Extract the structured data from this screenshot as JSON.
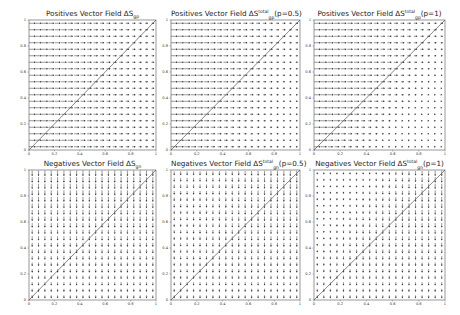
{
  "figure": {
    "rows": 2,
    "cols": 3
  },
  "chart_data": [
    {
      "type": "quiver",
      "id": "pos_gp",
      "title": "Positives Vector Field ΔS",
      "title_sub": "gp",
      "title_sup": "",
      "title_suffix": "",
      "direction": "horizontal",
      "p": 0,
      "xlim": [
        0,
        1
      ],
      "ylim": [
        0,
        1
      ],
      "xticks": [
        "0",
        "0.2",
        "0.4",
        "0.6",
        "0.8",
        "1"
      ],
      "yticks": [
        "0",
        "0.2",
        "0.4",
        "0.6",
        "0.8",
        "1"
      ],
      "diagonal": true,
      "grid_n": 20
    },
    {
      "type": "quiver",
      "id": "pos_total_p05",
      "title": "Positives Vector Field ΔS",
      "title_sub": "gp",
      "title_sup": "total",
      "title_suffix": "(p=0.5)",
      "direction": "horizontal",
      "p": 0.5,
      "xlim": [
        0,
        1
      ],
      "ylim": [
        0,
        1
      ],
      "xticks": [
        "0",
        "0.2",
        "0.4",
        "0.6",
        "0.8",
        "1"
      ],
      "yticks": [
        "0",
        "0.2",
        "0.4",
        "0.6",
        "0.8",
        "1"
      ],
      "diagonal": true,
      "grid_n": 20
    },
    {
      "type": "quiver",
      "id": "pos_total_p1",
      "title": "Positives Vector Field ΔS",
      "title_sub": "gp",
      "title_sup": "total",
      "title_suffix": "(p=1)",
      "direction": "horizontal",
      "p": 1,
      "xlim": [
        0,
        1
      ],
      "ylim": [
        0,
        1
      ],
      "xticks": [
        "0",
        "0.2",
        "0.4",
        "0.6",
        "0.8",
        "1"
      ],
      "yticks": [
        "0",
        "0.2",
        "0.4",
        "0.6",
        "0.8",
        "1"
      ],
      "diagonal": true,
      "grid_n": 20
    },
    {
      "type": "quiver",
      "id": "neg_gn",
      "title": "Negatives Vector Field ΔS",
      "title_sub": "gn",
      "title_sup": "",
      "title_suffix": "",
      "direction": "vertical",
      "p": 0,
      "xlim": [
        0,
        1
      ],
      "ylim": [
        0,
        1
      ],
      "xticks": [
        "0",
        "0.2",
        "0.4",
        "0.6",
        "0.8",
        "1"
      ],
      "yticks": [
        "0",
        "0.2",
        "0.4",
        "0.6",
        "0.8",
        "1"
      ],
      "diagonal": true,
      "grid_n": 20
    },
    {
      "type": "quiver",
      "id": "neg_total_p05",
      "title": "Negatives Vector Field ΔS",
      "title_sub": "gn",
      "title_sup": "total",
      "title_suffix": "(p=0.5)",
      "direction": "vertical",
      "p": 0.5,
      "xlim": [
        0,
        1
      ],
      "ylim": [
        0,
        1
      ],
      "xticks": [
        "0",
        "0.2",
        "0.4",
        "0.6",
        "0.8",
        "1"
      ],
      "yticks": [
        "0",
        "0.2",
        "0.4",
        "0.6",
        "0.8",
        "1"
      ],
      "diagonal": true,
      "grid_n": 20
    },
    {
      "type": "quiver",
      "id": "neg_total_p1",
      "title": "Negatives Vector Field ΔS",
      "title_sub": "gn",
      "title_sup": "total",
      "title_suffix": "(p=1)",
      "direction": "vertical",
      "p": 1,
      "xlim": [
        0,
        1
      ],
      "ylim": [
        0,
        1
      ],
      "xticks": [
        "0",
        "0.2",
        "0.4",
        "0.6",
        "0.8",
        "1"
      ],
      "yticks": [
        "0",
        "0.2",
        "0.4",
        "0.6",
        "0.8",
        "1"
      ],
      "diagonal": true,
      "grid_n": 20
    }
  ],
  "colors": {
    "arrow": "#333333",
    "axis": "#555555",
    "diagonal": "#555555"
  }
}
